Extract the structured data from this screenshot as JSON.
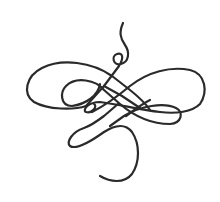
{
  "image": {
    "subject": "calligraphic flourish ornament",
    "background_color": "#ffffff",
    "stroke_color": "#2a2a2a",
    "stroke_width": 2.2
  }
}
